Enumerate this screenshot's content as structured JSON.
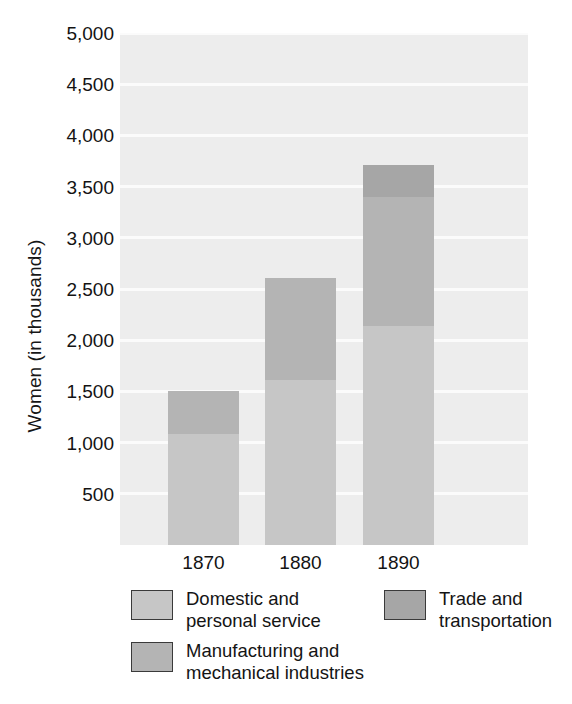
{
  "chart_data": {
    "type": "bar",
    "subtype": "stacked-bar",
    "title": "",
    "xlabel": "",
    "ylabel": "Women (in thousands)",
    "categories": [
      "1870",
      "1880",
      "1890"
    ],
    "series": [
      {
        "name": "Domestic and\npersonal service",
        "key": "domestic",
        "color": "#c6c6c6",
        "values": [
          1080,
          1610,
          2140
        ]
      },
      {
        "name": "Manufacturing and\nmechanical industries",
        "key": "manufacturing",
        "color": "#b4b4b4",
        "values": [
          420,
          1000,
          1260
        ]
      },
      {
        "name": "Trade and\ntransportation",
        "key": "trade",
        "color": "#a6a6a6",
        "values": [
          0,
          0,
          310
        ]
      }
    ],
    "totals": [
      1500,
      2610,
      3710
    ],
    "ylim": [
      0,
      5000
    ],
    "ytick_values": [
      5000,
      4500,
      4000,
      3500,
      3000,
      2500,
      2000,
      1500,
      1000,
      500
    ],
    "ytick_labels": [
      "5,000",
      "4,500",
      "4,000",
      "3,500",
      "3,000",
      "2,500",
      "2,000",
      "1,500",
      "1,000",
      "500"
    ],
    "grid": true,
    "grid_color": "#fbfbfb",
    "plot_background": "#ededed",
    "legend_position": "below",
    "legend": [
      {
        "label": "Domestic and\npersonal service",
        "color": "#c6c6c6"
      },
      {
        "label": "Manufacturing and\nmechanical industries",
        "color": "#b4b4b4"
      },
      {
        "label": "Trade and\ntransportation",
        "color": "#a6a6a6"
      }
    ]
  },
  "axis": {
    "y_title": "Women (in thousands)",
    "y_ticks": [
      "5,000",
      "4,500",
      "4,000",
      "3,500",
      "3,000",
      "2,500",
      "2,000",
      "1,500",
      "1,000",
      "500"
    ],
    "x_ticks": [
      "1870",
      "1880",
      "1890"
    ]
  },
  "legend": {
    "domestic_label": "Domestic and\npersonal service",
    "manufacturing_label": "Manufacturing and\nmechanical industries",
    "trade_label": "Trade and\ntransportation"
  }
}
